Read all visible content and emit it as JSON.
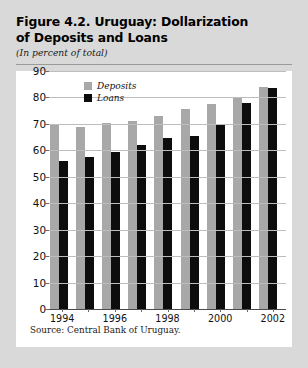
{
  "figure": {
    "title": "Figure 4.2. Uruguay: Dollarization of Deposits and Loans",
    "title_line1": "Figure 4.2. Uruguay: Dollarization",
    "title_line2": "of Deposits and Loans",
    "subtitle": "(In percent of total)",
    "source": "Source: Central Bank of Uruguay."
  },
  "colors": {
    "deposits": "#a8a8a8",
    "loans": "#0d0d0d",
    "page_background": "#d9d9d9",
    "panel_background": "#ffffff",
    "gridline": "#bdbdbd",
    "axis": "#4a4a4a"
  },
  "chart_data": {
    "type": "bar",
    "title": "Figure 4.2. Uruguay: Dollarization of Deposits and Loans",
    "subtitle": "(In percent of total)",
    "xlabel": "",
    "ylabel": "",
    "ylim": [
      0,
      90
    ],
    "yticks": [
      0,
      10,
      20,
      30,
      40,
      50,
      60,
      70,
      80,
      90
    ],
    "ytick_labels": [
      "0",
      "10",
      "20",
      "30",
      "40",
      "50",
      "60",
      "70",
      "80",
      "90"
    ],
    "grid": true,
    "legend_position": "top-left-inside",
    "categories": [
      "1994",
      "1995",
      "1996",
      "1997",
      "1998",
      "1999",
      "2000",
      "2001",
      "2002"
    ],
    "xtick_labels_shown": [
      "1994",
      "1996",
      "1998",
      "2000",
      "2002"
    ],
    "series": [
      {
        "name": "Deposits",
        "color": "#a8a8a8",
        "values": [
          70,
          69,
          70.5,
          71,
          73,
          75.5,
          77.5,
          80,
          84
        ]
      },
      {
        "name": "Loans",
        "color": "#0d0d0d",
        "values": [
          56,
          57.5,
          59.5,
          62,
          64.5,
          65.5,
          69.5,
          78,
          83.5
        ]
      }
    ],
    "source": "Source: Central Bank of Uruguay."
  }
}
